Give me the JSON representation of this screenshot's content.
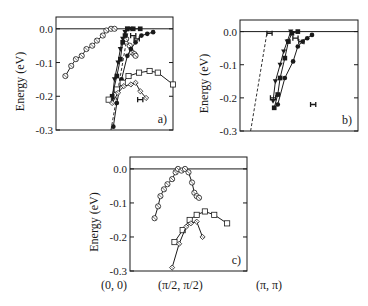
{
  "figure": {
    "y_axis_label": "Energy  (eV)",
    "x_tick_labels": [
      "(0, 0)",
      "(π/2, π/2)",
      "(π, π)"
    ],
    "y_tick_labels": [
      "0.0",
      "-0.1",
      "-0.2",
      "-0.3"
    ]
  },
  "chart_data": [
    {
      "type": "scatter",
      "panel_label": "a)",
      "ylabel": "Energy (eV)",
      "ylim": [
        -0.3,
        0.035
      ],
      "y_ticks": [
        0.0,
        -0.1,
        -0.2,
        -0.3
      ],
      "xlabel": "",
      "x_range_note": "momentum cut; x normalized 0..1 within frame",
      "frame": {
        "x": 56,
        "y": 17,
        "w": 117,
        "h": 113
      },
      "zero_line": true,
      "dashed_line": [
        [
          0.47,
          -0.3
        ],
        [
          0.62,
          0.0
        ]
      ],
      "series": [
        {
          "name": "open circles",
          "marker": "circle-open",
          "line": true,
          "points": [
            [
              0.08,
              -0.14
            ],
            [
              0.13,
              -0.11
            ],
            [
              0.17,
              -0.09
            ],
            [
              0.22,
              -0.08
            ],
            [
              0.26,
              -0.06
            ],
            [
              0.31,
              -0.05
            ],
            [
              0.35,
              -0.035
            ],
            [
              0.4,
              -0.02
            ],
            [
              0.43,
              -0.005
            ],
            [
              0.47,
              0.0
            ],
            [
              0.5,
              0.0
            ]
          ]
        },
        {
          "name": "open circles (right branch)",
          "marker": "circle-open",
          "line": true,
          "points": [
            [
              0.6,
              -0.03
            ],
            [
              0.63,
              -0.05
            ],
            [
              0.65,
              -0.07
            ],
            [
              0.67,
              -0.075
            ],
            [
              0.68,
              -0.08
            ]
          ]
        },
        {
          "name": "filled triangles",
          "marker": "triangle-filled",
          "line": true,
          "points": [
            [
              0.48,
              -0.21
            ],
            [
              0.5,
              -0.15
            ],
            [
              0.53,
              -0.1
            ],
            [
              0.55,
              -0.06
            ],
            [
              0.57,
              -0.03
            ],
            [
              0.59,
              -0.01
            ],
            [
              0.61,
              0.0
            ],
            [
              0.64,
              0.0
            ]
          ]
        },
        {
          "name": "filled squares",
          "marker": "square-filled",
          "line": true,
          "points": [
            [
              0.48,
              -0.2
            ],
            [
              0.52,
              -0.14
            ],
            [
              0.55,
              -0.09
            ],
            [
              0.57,
              -0.04
            ],
            [
              0.59,
              -0.02
            ],
            [
              0.61,
              0.0
            ],
            [
              0.66,
              0.0
            ],
            [
              0.72,
              0.0
            ]
          ]
        },
        {
          "name": "filled circles",
          "marker": "circle-filled",
          "line": true,
          "points": [
            [
              0.49,
              -0.29
            ],
            [
              0.52,
              -0.22
            ],
            [
              0.56,
              -0.15
            ],
            [
              0.61,
              -0.08
            ],
            [
              0.64,
              -0.06
            ],
            [
              0.68,
              -0.04
            ],
            [
              0.73,
              -0.02
            ],
            [
              0.78,
              -0.015
            ],
            [
              0.83,
              -0.01
            ]
          ]
        },
        {
          "name": "open squares",
          "marker": "square-open",
          "line": true,
          "points": [
            [
              0.45,
              -0.21
            ],
            [
              0.52,
              -0.18
            ],
            [
              0.57,
              -0.16
            ],
            [
              0.62,
              -0.14
            ],
            [
              0.71,
              -0.13
            ],
            [
              0.8,
              -0.125
            ],
            [
              0.87,
              -0.13
            ],
            [
              1.0,
              -0.165
            ]
          ]
        },
        {
          "name": "open diamonds",
          "marker": "diamond-open",
          "line": true,
          "points": [
            [
              0.48,
              -0.22
            ],
            [
              0.53,
              -0.19
            ],
            [
              0.58,
              -0.17
            ],
            [
              0.64,
              -0.165
            ],
            [
              0.68,
              -0.16
            ],
            [
              0.72,
              -0.185
            ],
            [
              0.77,
              -0.205
            ]
          ]
        },
        {
          "name": "bow-tie markers",
          "marker": "bowtie",
          "line": false,
          "points": [
            [
              0.66,
              -0.02
            ],
            [
              0.69,
              -0.03
            ],
            [
              0.72,
              -0.21
            ]
          ]
        }
      ]
    },
    {
      "type": "scatter",
      "panel_label": "b)",
      "ylabel": "Energy (eV)",
      "ylim": [
        -0.3,
        0.035
      ],
      "y_ticks": [
        0.0,
        -0.1,
        -0.2,
        -0.3
      ],
      "frame": {
        "x": 240,
        "y": 20,
        "w": 118,
        "h": 111
      },
      "zero_line": true,
      "dashed_line": [
        [
          0.09,
          -0.3
        ],
        [
          0.23,
          0.0
        ]
      ],
      "series": [
        {
          "name": "filled triangles",
          "marker": "triangle-filled",
          "line": true,
          "points": [
            [
              0.28,
              -0.21
            ],
            [
              0.3,
              -0.15
            ],
            [
              0.34,
              -0.1
            ],
            [
              0.37,
              -0.06
            ],
            [
              0.4,
              -0.03
            ],
            [
              0.43,
              0.0
            ]
          ]
        },
        {
          "name": "filled squares",
          "marker": "square-filled",
          "line": true,
          "points": [
            [
              0.29,
              -0.23
            ],
            [
              0.32,
              -0.19
            ],
            [
              0.34,
              -0.14
            ],
            [
              0.38,
              -0.08
            ],
            [
              0.41,
              -0.03
            ],
            [
              0.44,
              -0.005
            ],
            [
              0.49,
              0.0
            ]
          ]
        },
        {
          "name": "filled circles",
          "marker": "circle-filled",
          "line": true,
          "points": [
            [
              0.32,
              -0.22
            ],
            [
              0.38,
              -0.14
            ],
            [
              0.45,
              -0.09
            ],
            [
              0.49,
              -0.045
            ],
            [
              0.53,
              -0.03
            ],
            [
              0.57,
              -0.02
            ],
            [
              0.61,
              -0.01
            ]
          ]
        },
        {
          "name": "bow-tie markers",
          "marker": "bowtie",
          "line": false,
          "points": [
            [
              0.25,
              -0.005
            ],
            [
              0.28,
              -0.2
            ],
            [
              0.47,
              -0.02
            ],
            [
              0.52,
              -0.03
            ],
            [
              0.62,
              -0.22
            ]
          ]
        }
      ]
    },
    {
      "type": "scatter",
      "panel_label": "c)",
      "ylabel": "Energy (eV)",
      "ylim": [
        -0.3,
        0.035
      ],
      "y_ticks": [
        0.0,
        -0.1,
        -0.2,
        -0.3
      ],
      "x_ticks": [
        "(0, 0)",
        "(π/2, π/2)",
        "(π, π)"
      ],
      "frame": {
        "x": 130,
        "y": 157,
        "w": 117,
        "h": 114
      },
      "zero_line": true,
      "series": [
        {
          "name": "open circles",
          "marker": "circle-open",
          "line": true,
          "points": [
            [
              0.21,
              -0.145
            ],
            [
              0.24,
              -0.11
            ],
            [
              0.26,
              -0.08
            ],
            [
              0.29,
              -0.06
            ],
            [
              0.32,
              -0.045
            ],
            [
              0.36,
              -0.03
            ],
            [
              0.39,
              -0.01
            ],
            [
              0.41,
              0.0
            ],
            [
              0.44,
              -0.005
            ],
            [
              0.47,
              0.0
            ],
            [
              0.5,
              -0.01
            ],
            [
              0.53,
              -0.04
            ],
            [
              0.55,
              -0.07
            ],
            [
              0.57,
              -0.08
            ],
            [
              0.59,
              -0.085
            ]
          ]
        },
        {
          "name": "open squares",
          "marker": "square-open",
          "line": true,
          "points": [
            [
              0.38,
              -0.215
            ],
            [
              0.45,
              -0.18
            ],
            [
              0.51,
              -0.15
            ],
            [
              0.57,
              -0.135
            ],
            [
              0.64,
              -0.125
            ],
            [
              0.72,
              -0.135
            ],
            [
              0.83,
              -0.16
            ]
          ]
        },
        {
          "name": "open diamonds",
          "marker": "diamond-open",
          "line": true,
          "points": [
            [
              0.36,
              -0.29
            ],
            [
              0.42,
              -0.22
            ],
            [
              0.48,
              -0.17
            ],
            [
              0.52,
              -0.16
            ],
            [
              0.57,
              -0.155
            ],
            [
              0.62,
              -0.2
            ]
          ]
        }
      ]
    }
  ]
}
